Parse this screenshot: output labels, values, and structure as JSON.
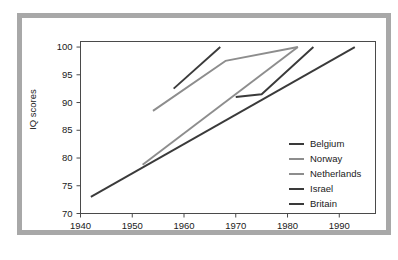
{
  "chart_data": {
    "type": "line",
    "title": "",
    "xlabel": "",
    "ylabel": "IQ scores",
    "xlim": [
      1940,
      1997
    ],
    "ylim": [
      70,
      101
    ],
    "grid": false,
    "legend_position": "inside-bottom-right",
    "x_ticks": [
      1940,
      1950,
      1960,
      1970,
      1980,
      1990
    ],
    "x_tick_labels": [
      "1940",
      "1950",
      "1960",
      "1970",
      "1980",
      "1990"
    ],
    "y_ticks": [
      70,
      75,
      80,
      85,
      90,
      95,
      100
    ],
    "y_tick_labels": [
      "70",
      "75",
      "80",
      "85",
      "90",
      "95",
      "100"
    ],
    "series": [
      {
        "name": "Belgium",
        "color": "#3a3a3a",
        "width": 1.9,
        "x": [
          1958,
          1967
        ],
        "y": [
          92.5,
          100.0
        ]
      },
      {
        "name": "Norway",
        "color": "#8d8d8d",
        "width": 1.9,
        "x": [
          1954,
          1968,
          1982
        ],
        "y": [
          88.5,
          97.5,
          100.0
        ]
      },
      {
        "name": "Netherlands",
        "color": "#8d8d8d",
        "width": 1.9,
        "x": [
          1952,
          1982
        ],
        "y": [
          78.8,
          100.0
        ]
      },
      {
        "name": "Israel",
        "color": "#3a3a3a",
        "width": 1.9,
        "x": [
          1970,
          1975,
          1985
        ],
        "y": [
          91.0,
          91.5,
          100.0
        ]
      },
      {
        "name": "Britain",
        "color": "#3a3a3a",
        "width": 1.9,
        "x": [
          1942,
          1993
        ],
        "y": [
          73.0,
          100.0
        ]
      }
    ]
  },
  "legend": {
    "items": [
      {
        "label": "Belgium",
        "color": "#3a3a3a"
      },
      {
        "label": "Norway",
        "color": "#8d8d8d"
      },
      {
        "label": "Netherlands",
        "color": "#8d8d8d"
      },
      {
        "label": "Israel",
        "color": "#3a3a3a"
      },
      {
        "label": "Britain",
        "color": "#3a3a3a"
      }
    ]
  },
  "style": {
    "outer_frame_color": "#a8a8a8",
    "axis_color": "#4a4a4a",
    "text_color": "#1a1a1a",
    "background": "#ffffff"
  }
}
